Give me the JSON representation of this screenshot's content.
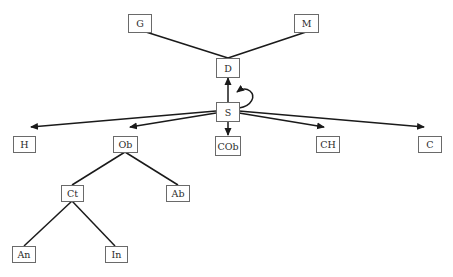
{
  "diagram": {
    "type": "tree",
    "nodes": [
      {
        "id": "G",
        "label": "G",
        "x": 128,
        "y": 14,
        "w": 23,
        "h": 18
      },
      {
        "id": "M",
        "label": "M",
        "x": 294,
        "y": 14,
        "w": 24,
        "h": 18
      },
      {
        "id": "D",
        "label": "D",
        "x": 216,
        "y": 58,
        "w": 23,
        "h": 19
      },
      {
        "id": "S",
        "label": "S",
        "x": 216,
        "y": 102,
        "w": 23,
        "h": 19
      },
      {
        "id": "H",
        "label": "H",
        "x": 13,
        "y": 136,
        "w": 22,
        "h": 16
      },
      {
        "id": "Ob",
        "label": "Ob",
        "x": 113,
        "y": 136,
        "w": 24,
        "h": 16
      },
      {
        "id": "COb",
        "label": "COb",
        "x": 215,
        "y": 136,
        "w": 25,
        "h": 19
      },
      {
        "id": "CH",
        "label": "CH",
        "x": 316,
        "y": 136,
        "w": 23,
        "h": 16
      },
      {
        "id": "C",
        "label": "C",
        "x": 418,
        "y": 136,
        "w": 23,
        "h": 16
      },
      {
        "id": "Ct",
        "label": "Ct",
        "x": 61,
        "y": 185,
        "w": 22,
        "h": 16
      },
      {
        "id": "Ab",
        "label": "Ab",
        "x": 166,
        "y": 185,
        "w": 23,
        "h": 16
      },
      {
        "id": "An",
        "label": "An",
        "x": 12,
        "y": 246,
        "w": 23,
        "h": 16
      },
      {
        "id": "In",
        "label": "In",
        "x": 105,
        "y": 246,
        "w": 22,
        "h": 16
      }
    ],
    "edges": [
      {
        "from": "G",
        "to": "D",
        "directed": false,
        "path": [
          [
            146,
            32
          ],
          [
            228,
            58
          ]
        ]
      },
      {
        "from": "M",
        "to": "D",
        "directed": false,
        "path": [
          [
            306,
            32
          ],
          [
            228,
            58
          ]
        ]
      },
      {
        "from": "S",
        "to": "D",
        "directed": true,
        "path": [
          [
            228,
            102
          ],
          [
            228,
            78
          ]
        ]
      },
      {
        "from": "S",
        "to": "S",
        "directed": true,
        "self_loop": true
      },
      {
        "from": "S",
        "to": "H",
        "directed": true,
        "path": [
          [
            216,
            111
          ],
          [
            30,
            127
          ]
        ]
      },
      {
        "from": "S",
        "to": "Ob",
        "directed": true,
        "path": [
          [
            216,
            113
          ],
          [
            129,
            127
          ]
        ]
      },
      {
        "from": "S",
        "to": "COb",
        "directed": true,
        "path": [
          [
            228,
            121
          ],
          [
            228,
            135
          ]
        ]
      },
      {
        "from": "S",
        "to": "CH",
        "directed": true,
        "path": [
          [
            239,
            113
          ],
          [
            325,
            127
          ]
        ]
      },
      {
        "from": "S",
        "to": "C",
        "directed": true,
        "path": [
          [
            239,
            111
          ],
          [
            425,
            127
          ]
        ]
      },
      {
        "from": "Ob",
        "to": "Ct",
        "directed": false,
        "path": [
          [
            125,
            152
          ],
          [
            72,
            185
          ]
        ]
      },
      {
        "from": "Ob",
        "to": "Ab",
        "directed": false,
        "path": [
          [
            125,
            152
          ],
          [
            178,
            185
          ]
        ]
      },
      {
        "from": "Ct",
        "to": "An",
        "directed": false,
        "path": [
          [
            72,
            201
          ],
          [
            24,
            246
          ]
        ]
      },
      {
        "from": "Ct",
        "to": "In",
        "directed": false,
        "path": [
          [
            72,
            201
          ],
          [
            115,
            246
          ]
        ]
      }
    ]
  },
  "colors": {
    "background": "#ffffff",
    "edge": "#1a1a1a",
    "box_border": "#6a6a6a",
    "text": "#2a2a2a"
  }
}
